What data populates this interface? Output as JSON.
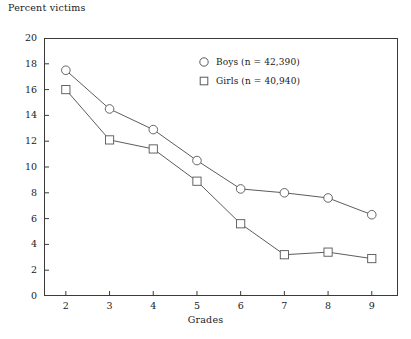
{
  "chart_data": {
    "type": "line",
    "title": "",
    "ylabel": "Percent victims",
    "xlabel": "Grades",
    "categories": [
      "2",
      "3",
      "4",
      "5",
      "6",
      "7",
      "8",
      "9"
    ],
    "x": [
      2,
      3,
      4,
      5,
      6,
      7,
      8,
      9
    ],
    "xlim": [
      1.5,
      9.6
    ],
    "ylim": [
      0,
      20
    ],
    "yticks": [
      0,
      2,
      4,
      6,
      8,
      10,
      12,
      14,
      16,
      18,
      20
    ],
    "xticks": [
      2,
      3,
      4,
      5,
      6,
      7,
      8,
      9
    ],
    "grid": false,
    "legend_position": "upper-center-right",
    "series": [
      {
        "name": "Boys (n = 42,390)",
        "short_name": "Boys",
        "sample_size": "42,390",
        "marker": "circle",
        "values": [
          17.5,
          14.5,
          12.9,
          10.5,
          8.3,
          8.0,
          7.6,
          6.3
        ]
      },
      {
        "name": "Girls (n = 40,940)",
        "short_name": "Girls",
        "sample_size": "40,940",
        "marker": "square",
        "values": [
          16.0,
          12.1,
          11.4,
          8.9,
          5.6,
          3.2,
          3.4,
          2.9
        ]
      }
    ]
  },
  "legend": {
    "items": [
      {
        "label": "Boys (n = 42,390)",
        "marker": "circle-marker"
      },
      {
        "label": "Girls (n = 40,940)",
        "marker": "square-marker"
      }
    ]
  },
  "colors": {
    "line": "#4a4a4a",
    "axis": "#3a3a3a",
    "text": "#1a1a1a",
    "background": "#ffffff"
  }
}
